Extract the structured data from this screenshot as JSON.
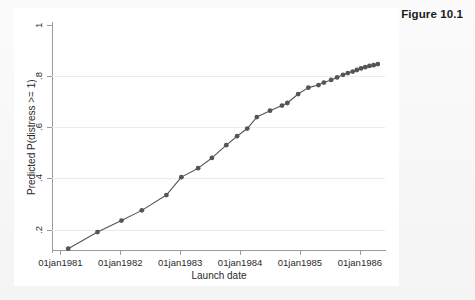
{
  "figure": {
    "title": "Figure 10.1"
  },
  "chart_data": {
    "type": "line",
    "title": "Figure 10.1",
    "xlabel": "Launch date",
    "ylabel": "Predicted P(distress >= 1)",
    "grid": true,
    "legend": null,
    "marker": "filled-circle",
    "line_color": "#555555",
    "marker_color": "#555555",
    "xlim": [
      "01jan1981",
      "01jul1986"
    ],
    "ylim": [
      0.12,
      1.0
    ],
    "xtick_labels": [
      "01jan1981",
      "01jan1982",
      "01jan1983",
      "01jan1984",
      "01jan1985",
      "01jan1986"
    ],
    "xtick_values": [
      1981.0,
      1982.0,
      1983.0,
      1984.0,
      1985.0,
      1986.0
    ],
    "ytick_labels": [
      "1",
      ".8",
      ".6",
      ".4",
      ".2"
    ],
    "ytick_values": [
      1.0,
      0.8,
      0.6,
      0.4,
      0.2
    ],
    "x": [
      1981.13,
      1981.62,
      1982.02,
      1982.36,
      1982.77,
      1983.02,
      1983.3,
      1983.53,
      1983.77,
      1983.95,
      1984.12,
      1984.28,
      1984.5,
      1984.7,
      1984.79,
      1984.97,
      1985.14,
      1985.31,
      1985.4,
      1985.52,
      1985.62,
      1985.72,
      1985.8,
      1985.88,
      1985.95,
      1986.02,
      1986.09,
      1986.16,
      1986.23,
      1986.3
    ],
    "y": [
      0.125,
      0.19,
      0.235,
      0.275,
      0.335,
      0.405,
      0.44,
      0.48,
      0.53,
      0.565,
      0.595,
      0.64,
      0.665,
      0.685,
      0.695,
      0.73,
      0.755,
      0.765,
      0.775,
      0.785,
      0.795,
      0.805,
      0.812,
      0.818,
      0.824,
      0.83,
      0.835,
      0.84,
      0.843,
      0.847
    ],
    "series": [
      {
        "name": "Predicted P(distress >= 1)",
        "values": [
          0.125,
          0.19,
          0.235,
          0.275,
          0.335,
          0.405,
          0.44,
          0.48,
          0.53,
          0.565,
          0.595,
          0.64,
          0.665,
          0.685,
          0.695,
          0.73,
          0.755,
          0.765,
          0.775,
          0.785,
          0.795,
          0.805,
          0.812,
          0.818,
          0.824,
          0.83,
          0.835,
          0.84,
          0.843,
          0.847
        ]
      }
    ]
  }
}
